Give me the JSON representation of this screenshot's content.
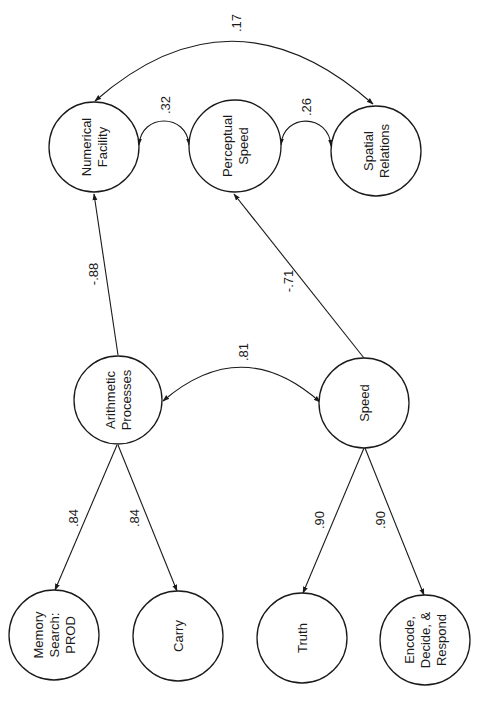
{
  "diagram": {
    "type": "structural-equation-path-diagram",
    "orientation": "rotated-90-ccw",
    "colors": {
      "stroke": "#1a1a1a",
      "background": "#ffffff"
    },
    "nodes": {
      "numerical_facility": {
        "lines": [
          "Numerical",
          "Facility"
        ]
      },
      "perceptual_speed": {
        "lines": [
          "Perceptual",
          "Speed"
        ]
      },
      "spatial_relations": {
        "lines": [
          "Spatial",
          "Relations"
        ]
      },
      "arithmetic_processes": {
        "lines": [
          "Arithmetic",
          "Processes"
        ]
      },
      "speed": {
        "lines": [
          "Speed"
        ]
      },
      "memory_search": {
        "lines": [
          "Memory",
          "Search:",
          "PROD"
        ]
      },
      "carry": {
        "lines": [
          "Carry"
        ]
      },
      "truth": {
        "lines": [
          "Truth"
        ]
      },
      "encode_decide_respond": {
        "lines": [
          "Encode,",
          "Decide, &",
          "Respond"
        ]
      }
    },
    "edges": {
      "nf_sr_corr": {
        "from": "Numerical Facility",
        "to": "Spatial Relations",
        "type": "correlation",
        "label": ".17"
      },
      "nf_ps_corr": {
        "from": "Numerical Facility",
        "to": "Perceptual Speed",
        "type": "correlation",
        "label": ".32"
      },
      "ps_sr_corr": {
        "from": "Perceptual Speed",
        "to": "Spatial Relations",
        "type": "correlation",
        "label": ".26"
      },
      "ap_sp_corr": {
        "from": "Arithmetic Processes",
        "to": "Speed",
        "type": "correlation",
        "label": ".81"
      },
      "ap_nf_path": {
        "from": "Arithmetic Processes",
        "to": "Numerical Facility",
        "type": "path",
        "label": "-.88"
      },
      "sp_ps_path": {
        "from": "Speed",
        "to": "Perceptual Speed",
        "type": "path",
        "label": "-.71"
      },
      "ap_ms_load": {
        "from": "Arithmetic Processes",
        "to": "Memory Search: PROD",
        "type": "loading",
        "label": ".84"
      },
      "ap_carry_load": {
        "from": "Arithmetic Processes",
        "to": "Carry",
        "type": "loading",
        "label": ".84"
      },
      "sp_truth_load": {
        "from": "Speed",
        "to": "Truth",
        "type": "loading",
        "label": ".90"
      },
      "sp_edr_load": {
        "from": "Speed",
        "to": "Encode, Decide, & Respond",
        "type": "loading",
        "label": ".90"
      }
    }
  }
}
